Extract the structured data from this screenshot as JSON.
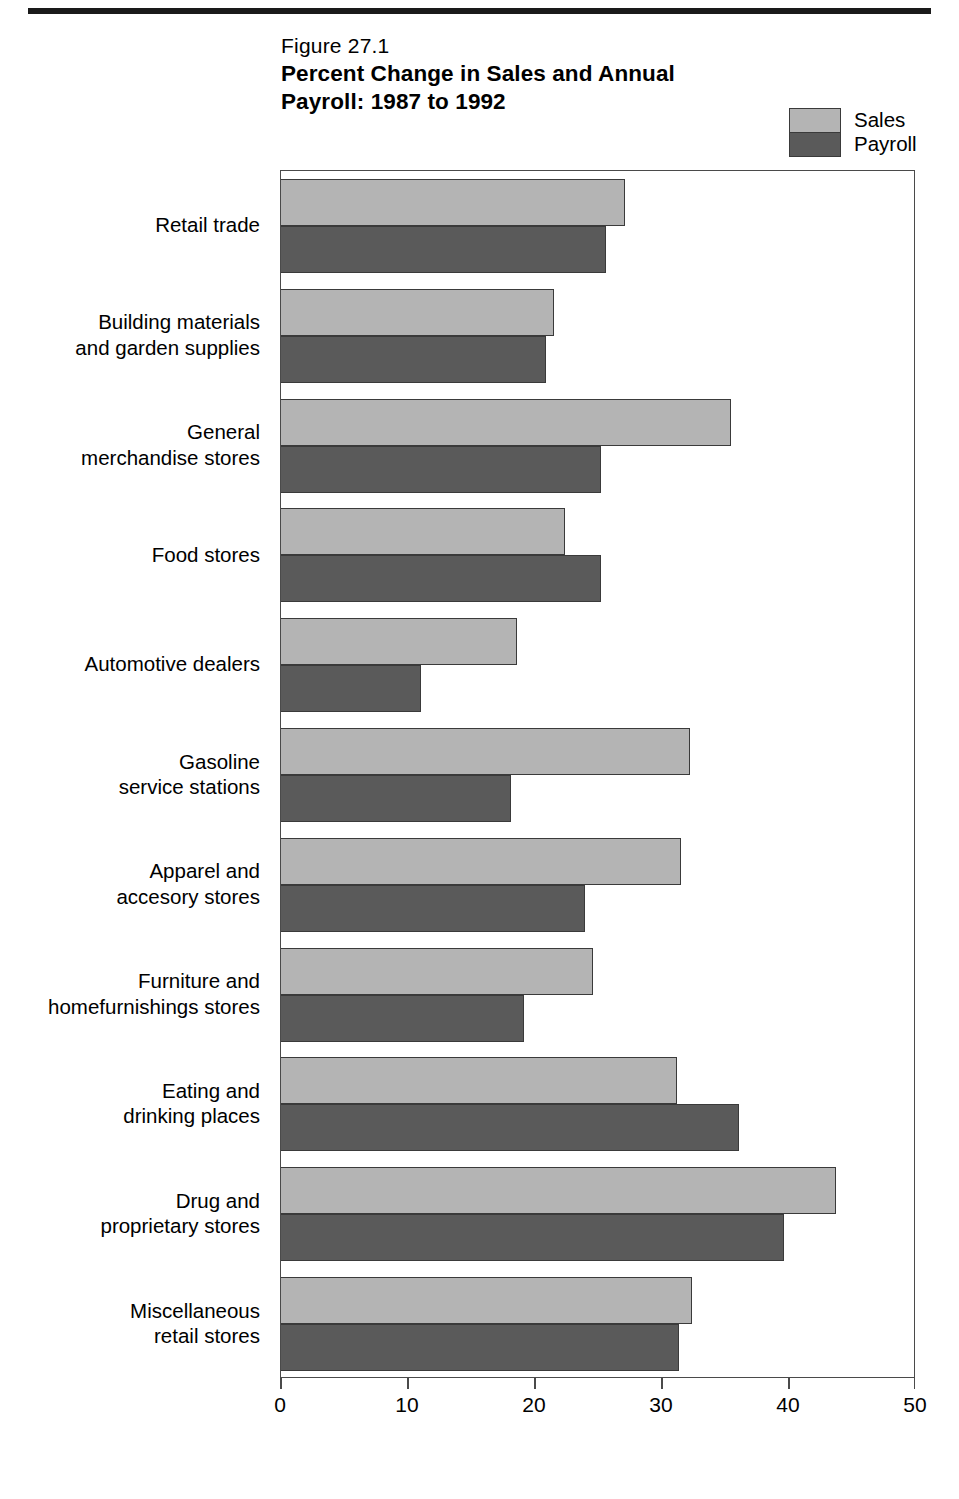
{
  "figure": {
    "number": "Figure 27.1",
    "title": "Percent Change in Sales and Annual\nPayroll:  1987 to 1992"
  },
  "legend": {
    "position": "top-right",
    "entries": [
      {
        "label": "Sales",
        "color": "#b4b4b4"
      },
      {
        "label": "Payroll",
        "color": "#5a5a5a"
      }
    ]
  },
  "chart_data": {
    "type": "bar",
    "orientation": "horizontal",
    "title": "Percent Change in Sales and Annual Payroll:  1987 to 1992",
    "xlabel": "",
    "ylabel": "",
    "xlim": [
      0,
      50
    ],
    "grid": false,
    "legend_position": "top-right",
    "xticks": [
      "0",
      "10",
      "20",
      "30",
      "40",
      "50"
    ],
    "xtick_values": [
      0,
      10,
      20,
      30,
      40,
      50
    ],
    "categories": [
      "Retail trade",
      "Building materials\nand garden supplies",
      "General\nmerchandise stores",
      "Food stores",
      "Automotive dealers",
      "Gasoline\nservice stations",
      "Apparel and\naccesory stores",
      "Furniture and\nhomefurnishings stores",
      "Eating and\ndrinking places",
      "Drug and\nproprietary stores",
      "Miscellaneous\nretail stores"
    ],
    "series": [
      {
        "name": "Sales",
        "color": "#b4b4b4",
        "values": [
          27.1,
          21.5,
          35.4,
          22.4,
          18.6,
          32.2,
          31.5,
          24.6,
          31.2,
          43.7,
          32.4
        ]
      },
      {
        "name": "Payroll",
        "color": "#5a5a5a",
        "values": [
          25.6,
          20.9,
          25.2,
          25.2,
          11.0,
          18.1,
          23.9,
          19.1,
          36.1,
          39.6,
          31.3
        ]
      }
    ]
  }
}
